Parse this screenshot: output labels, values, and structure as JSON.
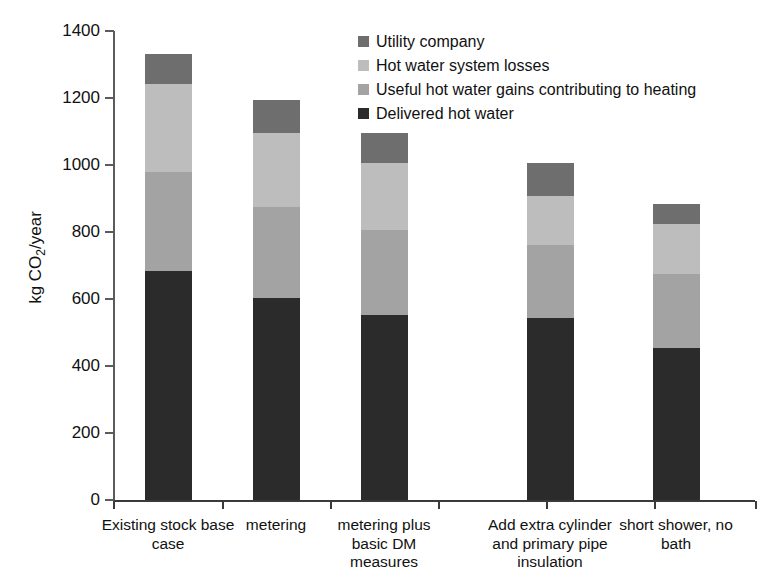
{
  "chart_data": {
    "type": "bar",
    "subtype": "stacked-bar",
    "title": "",
    "xlabel": "",
    "ylabel": "kg CO2/year",
    "ylabel_display": "kg CO",
    "ylabel_sub": "2",
    "ylabel_tail": "/year",
    "ylim": [
      0,
      1400
    ],
    "ytick_step": 200,
    "ytick_labels": [
      "1400",
      "1200",
      "1000",
      "800",
      "600",
      "400",
      "200",
      "0"
    ],
    "ytick_values": [
      1400,
      1200,
      1000,
      800,
      600,
      400,
      200,
      0
    ],
    "grid": false,
    "legend_position": "top-right",
    "categories": [
      "Existing stock base case",
      "metering",
      "metering plus basic DM measures",
      "Add extra cylinder and primary pipe insulation",
      "short shower, no bath"
    ],
    "category_label_lines": [
      [
        "Existing stock base",
        "case"
      ],
      [
        "metering"
      ],
      [
        "metering plus",
        "basic DM",
        "measures"
      ],
      [
        "Add extra cylinder",
        "and primary pipe",
        "insulation"
      ],
      [
        "short shower, no",
        "bath"
      ]
    ],
    "stack_order_bottom_to_top": [
      "Delivered hot water",
      "Useful hot water gains contributing to heating",
      "Hot water system losses",
      "Utility company"
    ],
    "series": [
      {
        "name": "Delivered hot water",
        "color": "#2b2b2b",
        "values": [
          683,
          603,
          553,
          543,
          455
        ]
      },
      {
        "name": "Useful hot water gains contributing to heating",
        "color": "#a3a3a3",
        "values": [
          295,
          272,
          254,
          218,
          221
        ]
      },
      {
        "name": "Hot water system losses",
        "color": "#bdbdbd",
        "values": [
          263,
          221,
          200,
          146,
          149
        ]
      },
      {
        "name": "Utility company",
        "color": "#6e6e6e",
        "values": [
          90,
          99,
          88,
          98,
          60
        ]
      }
    ],
    "totals": [
      1331,
      1195,
      1095,
      1005,
      885
    ]
  },
  "legend": {
    "items": [
      {
        "label": "Utility company",
        "color": "#6e6e6e"
      },
      {
        "label": "Hot water system losses",
        "color": "#bdbdbd"
      },
      {
        "label": "Useful hot water gains contributing to heating",
        "color": "#a3a3a3"
      },
      {
        "label": "Delivered hot water",
        "color": "#2b2b2b"
      }
    ]
  },
  "axis": {
    "line_color": "#5b5b5b"
  },
  "caption": {
    "partial_text": ""
  }
}
